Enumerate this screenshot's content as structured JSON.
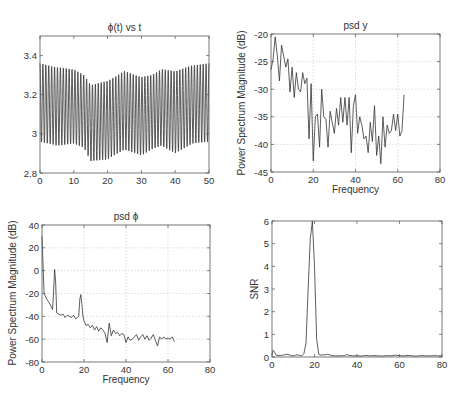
{
  "chart_data": [
    {
      "id": "phi_vs_t",
      "type": "line",
      "title": "ϕ(t) vs t",
      "xlabel": "",
      "ylabel": "",
      "xlim": [
        0,
        50
      ],
      "ylim": [
        2.8,
        3.5
      ],
      "xticks": [
        0,
        10,
        20,
        30,
        40,
        50
      ],
      "xtick_labels": [
        "0",
        "10",
        "20",
        "30",
        "40",
        "50"
      ],
      "yticks": [
        2.8,
        3.0,
        3.2,
        3.4
      ],
      "ytick_labels": [
        "2.8",
        "3",
        "3.2",
        "3.4"
      ],
      "grid": false,
      "box": {
        "left": 40,
        "top": 36,
        "right": 209,
        "bottom": 173
      },
      "signal": {
        "description": "Oscillation of ~1.16 period per unit t (about 58 cycles over 0-50) centred near 3.12 with amplitude envelope",
        "cycles": 58,
        "envelope_t": [
          0,
          5,
          10,
          13,
          15,
          20,
          25,
          30,
          33,
          36,
          40,
          45,
          50
        ],
        "envelope_max": [
          3.36,
          3.34,
          3.33,
          3.3,
          3.25,
          3.27,
          3.32,
          3.29,
          3.3,
          3.33,
          3.32,
          3.35,
          3.36
        ],
        "envelope_min": [
          2.96,
          2.94,
          2.95,
          2.93,
          2.86,
          2.87,
          2.92,
          2.89,
          2.92,
          2.94,
          2.9,
          2.95,
          2.96
        ]
      }
    },
    {
      "id": "psd_y",
      "type": "line",
      "title": "psd y",
      "xlabel": "Frequency",
      "ylabel": "Power Spectrum Magnitude (dB)",
      "xlim": [
        0,
        80
      ],
      "ylim": [
        -45,
        -20
      ],
      "xticks": [
        0,
        20,
        40,
        60,
        80
      ],
      "xtick_labels": [
        "0",
        "20",
        "40",
        "60",
        "80"
      ],
      "yticks": [
        -45,
        -40,
        -35,
        -30,
        -25,
        -20
      ],
      "ytick_labels": [
        "-45",
        "-40",
        "-35",
        "-30",
        "-25",
        "-20"
      ],
      "grid": true,
      "box": {
        "left": 271,
        "top": 34,
        "right": 440,
        "bottom": 172
      },
      "x": [
        0,
        1,
        2,
        3,
        4,
        5,
        6,
        7,
        8,
        9,
        10,
        11,
        12,
        13,
        14,
        15,
        16,
        17,
        18,
        19,
        20,
        21,
        22,
        23,
        24,
        25,
        26,
        27,
        28,
        29,
        30,
        31,
        32,
        33,
        34,
        35,
        36,
        37,
        38,
        39,
        40,
        41,
        42,
        43,
        44,
        45,
        46,
        47,
        48,
        49,
        50,
        51,
        52,
        53,
        54,
        55,
        56,
        57,
        58,
        59,
        60,
        61,
        62,
        63
      ],
      "values": [
        -26.5,
        -24.5,
        -20.5,
        -24,
        -28.5,
        -22,
        -24,
        -26,
        -24.5,
        -30.5,
        -26,
        -31.5,
        -27,
        -30,
        -30.5,
        -27,
        -29,
        -28,
        -39,
        -29,
        -43,
        -35,
        -34.5,
        -40.5,
        -30,
        -35,
        -35.5,
        -40.5,
        -34,
        -36,
        -38,
        -33.5,
        -36.5,
        -31.5,
        -36,
        -31.5,
        -36.5,
        -31.5,
        -41.5,
        -33,
        -31,
        -38,
        -35,
        -36.5,
        -39,
        -38.5,
        -41.5,
        -36,
        -39.5,
        -33,
        -42,
        -38.5,
        -43.5,
        -35,
        -40.5,
        -36.5,
        -38,
        -37.5,
        -34.5,
        -37.5,
        -34.5,
        -38.5,
        -37.5,
        -31
      ]
    },
    {
      "id": "psd_phi",
      "type": "line",
      "title": "psd ϕ",
      "xlabel": "Frequency",
      "ylabel": "Power Spectrum Magnitude (dB)",
      "xlim": [
        0,
        80
      ],
      "ylim": [
        -80,
        40
      ],
      "xticks": [
        0,
        20,
        40,
        60,
        80
      ],
      "xtick_labels": [
        "0",
        "20",
        "40",
        "60",
        "80"
      ],
      "yticks": [
        -80,
        -60,
        -40,
        -20,
        0,
        20,
        40
      ],
      "ytick_labels": [
        "-80",
        "-60",
        "-40",
        "-20",
        "0",
        "20",
        "40"
      ],
      "grid": true,
      "box": {
        "left": 42,
        "top": 225,
        "right": 210,
        "bottom": 362
      },
      "x": [
        0,
        0.5,
        1,
        2,
        3,
        4,
        5,
        5.5,
        6,
        6.5,
        7,
        8,
        9,
        10,
        11,
        12,
        13,
        14,
        15,
        16,
        17,
        17.5,
        18,
        18.5,
        19,
        19.5,
        20,
        21,
        22,
        23,
        24,
        25,
        26,
        27,
        28,
        29,
        30,
        31,
        32,
        33,
        34,
        35,
        36,
        37,
        38,
        39,
        40,
        41,
        42,
        43,
        44,
        45,
        46,
        47,
        48,
        49,
        50,
        51,
        52,
        53,
        54,
        55,
        56,
        57,
        58,
        59,
        60,
        61,
        62,
        63
      ],
      "values": [
        30,
        5,
        -20,
        -24,
        -27,
        -30,
        -34,
        -20,
        1,
        -10,
        -37,
        -38,
        -39,
        -38,
        -41,
        -39,
        -40,
        -41,
        -39,
        -42,
        -41,
        -40,
        -25,
        -21,
        -30,
        -40,
        -44,
        -48,
        -47,
        -50,
        -48,
        -52,
        -49,
        -53,
        -50,
        -52,
        -55,
        -63,
        -46,
        -57,
        -52,
        -55,
        -54,
        -57,
        -55,
        -56,
        -63,
        -58,
        -61,
        -60,
        -58,
        -56,
        -61,
        -58,
        -56,
        -60,
        -57,
        -61,
        -59,
        -56,
        -61,
        -66,
        -58,
        -60,
        -58,
        -60,
        -59,
        -60,
        -58,
        -62
      ]
    },
    {
      "id": "snr",
      "type": "line",
      "title": "",
      "xlabel": "",
      "ylabel": "SNR",
      "xlim": [
        0,
        80
      ],
      "ylim": [
        0,
        6
      ],
      "xticks": [
        0,
        20,
        40,
        60,
        80
      ],
      "xtick_labels": [
        "0",
        "20",
        "40",
        "60",
        "80"
      ],
      "yticks": [
        0,
        1,
        2,
        3,
        4,
        5,
        6
      ],
      "ytick_labels": [
        "0",
        "1",
        "2",
        "3",
        "4",
        "5",
        "6"
      ],
      "grid": false,
      "box": {
        "left": 272,
        "top": 221,
        "right": 442,
        "bottom": 357
      },
      "x": [
        0,
        0.5,
        1,
        2,
        3,
        4,
        5,
        6,
        7,
        8,
        9,
        10,
        11,
        12,
        13,
        14,
        15,
        16,
        17,
        18,
        19,
        20,
        21,
        22,
        23,
        24,
        25,
        26,
        27,
        28,
        30,
        32,
        34,
        35,
        36,
        38,
        40,
        42,
        44,
        46,
        48,
        50,
        52,
        54,
        56,
        58,
        60,
        62,
        64,
        66,
        68,
        70,
        72,
        74,
        76,
        78,
        80
      ],
      "values": [
        0.1,
        0.3,
        0.25,
        0.08,
        0.06,
        0.07,
        0.08,
        0.1,
        0.12,
        0.1,
        0.06,
        0.05,
        0.08,
        0.1,
        0.07,
        0.05,
        0.15,
        0.6,
        3.0,
        5.2,
        6.0,
        4.0,
        0.8,
        0.12,
        0.08,
        0.1,
        0.09,
        0.12,
        0.1,
        0.06,
        0.05,
        0.05,
        0.06,
        0.1,
        0.08,
        0.05,
        0.06,
        0.04,
        0.07,
        0.05,
        0.06,
        0.05,
        0.04,
        0.06,
        0.05,
        0.08,
        0.06,
        0.05,
        0.07,
        0.05,
        0.04,
        0.06,
        0.05,
        0.05,
        0.06,
        0.05,
        0.05
      ]
    }
  ]
}
